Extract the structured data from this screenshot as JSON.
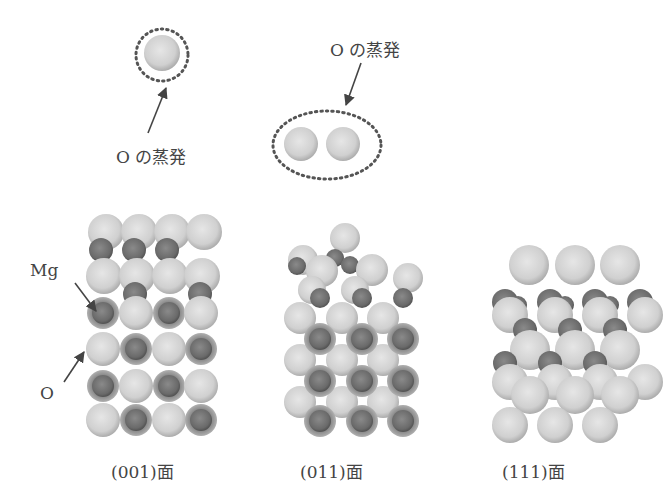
{
  "figure": {
    "annotations": {
      "evap_single": "O の蒸発",
      "evap_pair": "O の蒸発",
      "mg_label": "Mg",
      "o_label": "O"
    },
    "captions": {
      "surface_001": "(001)面",
      "surface_011": "(011)面",
      "surface_111": "(111)面"
    },
    "colors": {
      "oxygen": "#d2d2d2",
      "magnesium": "#6e6e6e",
      "dotted_outline": "#555555",
      "arrow": "#444444"
    }
  }
}
